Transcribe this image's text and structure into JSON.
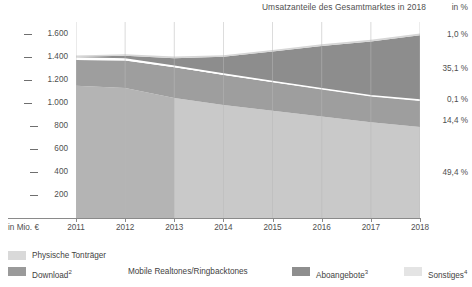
{
  "header": {
    "title": "Umsatzanteile des Gesamtmarktes in 2018",
    "percent_header": "in %"
  },
  "axes": {
    "y_unit_label": "in Mio. €",
    "y_ticks": [
      "1.600",
      "1.400",
      "1.200",
      "1.000",
      "800",
      "600",
      "400",
      "200"
    ],
    "x_ticks": [
      "2011",
      "2012",
      "2013",
      "2014",
      "2015",
      "2016",
      "2017",
      "2018"
    ]
  },
  "share_callouts": [
    {
      "label": "1,0 %",
      "series": "Sonstiges"
    },
    {
      "label": "35,1 %",
      "series": "Aboangebote"
    },
    {
      "label": "0,1 %",
      "series": "Mobile Realtones/Ringbacktones"
    },
    {
      "label": "14,4 %",
      "series": "Download"
    },
    {
      "label": "49,4 %",
      "series": "Physische Tonträger"
    }
  ],
  "legend": [
    {
      "label": "Physische Tonträger",
      "color": "#d9d9d9",
      "swatch": true
    },
    {
      "label": "Download",
      "sup": "2",
      "color": "#9a9a9a",
      "swatch": true
    },
    {
      "label": "Mobile Realtones/Ringbacktones",
      "sup": "",
      "color": "#ffffff",
      "swatch": false
    },
    {
      "label": "Aboangebote",
      "sup": "3",
      "color": "#8e8e8e",
      "swatch": true
    },
    {
      "label": "Sonstiges",
      "sup": "4",
      "color": "#e4e4e4",
      "swatch": true
    }
  ],
  "colors": {
    "physische": "#c9c9c9",
    "physische_left": "#b4b4b4",
    "download": "#9e9e9e",
    "mobile": "#ffffff",
    "abo": "#8d8d8d",
    "sonstiges": "#d6d6d6",
    "gridline": "#b9b9b9",
    "axis": "#8a8a8a",
    "text": "#4f4f4f"
  },
  "chart_data": {
    "type": "area",
    "title": "Umsatzanteile des Gesamtmarktes in 2018",
    "xlabel": "",
    "ylabel": "in Mio. €",
    "ylim": [
      0,
      1700
    ],
    "yticks": [
      200,
      400,
      600,
      800,
      1000,
      1200,
      1400,
      1600
    ],
    "grid": true,
    "legend_position": "bottom",
    "stacked": true,
    "x": [
      2011,
      2012,
      2013,
      2014,
      2015,
      2016,
      2017,
      2018
    ],
    "series": [
      {
        "name": "Physische Tonträger",
        "color": "#c9c9c9",
        "values": [
          1148,
          1128,
          1040,
          980,
          930,
          880,
          830,
          790
        ]
      },
      {
        "name": "Download",
        "sup": "2",
        "color": "#9e9e9e",
        "values": [
          222,
          238,
          268,
          262,
          250,
          238,
          228,
          230
        ]
      },
      {
        "name": "Mobile Realtones/Ringbacktones",
        "sup": "",
        "color": "#ffffff",
        "values": [
          18,
          12,
          8,
          6,
          4,
          3,
          2,
          2
        ]
      },
      {
        "name": "Aboangebote",
        "sup": "3",
        "color": "#8d8d8d",
        "values": [
          10,
          30,
          70,
          150,
          260,
          370,
          470,
          562
        ]
      },
      {
        "name": "Sonstiges",
        "sup": "4",
        "color": "#d6d6d6",
        "values": [
          12,
          12,
          14,
          14,
          14,
          15,
          15,
          16
        ]
      }
    ],
    "totals": [
      1410,
      1420,
      1400,
      1412,
      1458,
      1506,
      1545,
      1600
    ],
    "shares_2018": {
      "Sonstiges": "1,0 %",
      "Aboangebote": "35,1 %",
      "Mobile Realtones/Ringbacktones": "0,1 %",
      "Download": "14,4 %",
      "Physische Tonträger": "49,4 %"
    }
  }
}
